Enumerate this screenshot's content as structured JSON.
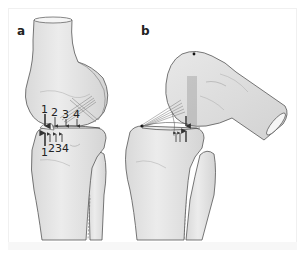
{
  "figure": {
    "panels": [
      {
        "label": "a",
        "description": "Knee joint in extension, lateral view",
        "upper_arrow_labels": [
          "1",
          "2",
          "3",
          "4"
        ],
        "lower_arrow_labels": [
          "1",
          "2",
          "3",
          "4"
        ]
      },
      {
        "label": "b",
        "description": "Knee joint in flexion, lateral view"
      }
    ],
    "colors": {
      "bone_fill": "#e6e6e6",
      "bone_shadow": "#cfcfcf",
      "outline": "#555555",
      "ligament": "#8a8a8a",
      "arrow": "#333333",
      "background": "#ffffff"
    }
  }
}
